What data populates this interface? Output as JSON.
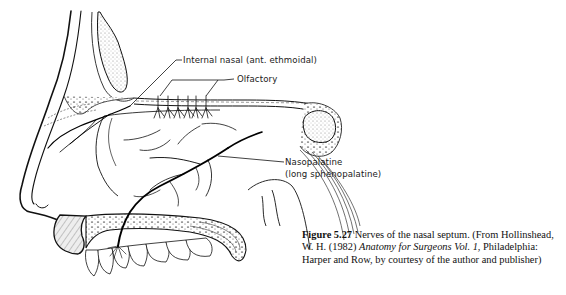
{
  "figure": {
    "labels": {
      "internal_nasal": "Internal nasal (ant. ethmoidal)",
      "olfactory": "Olfactory",
      "nasopalatine_line1": "Nasopalatine",
      "nasopalatine_line2": "(long sphenopalatine)"
    },
    "caption": {
      "figure_number": "Figure 5.27",
      "text_before_title": " Nerves of the nasal septum. (From Hollinshead, W. H. (1982) ",
      "book_title": "Anatomy for Surgeons Vol. 1",
      "text_after_title": ", Philadelphia: Harper and Row, by courtesy of the author and publisher)"
    }
  }
}
